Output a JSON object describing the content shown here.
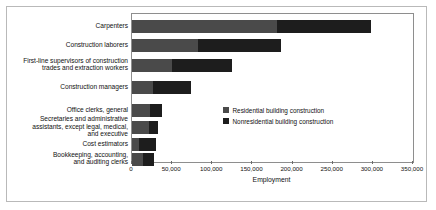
{
  "chart_data": {
    "type": "bar",
    "orientation": "horizontal",
    "stacked": true,
    "title": "",
    "xlabel": "Employment",
    "ylabel": "",
    "xlim": [
      0,
      350000
    ],
    "xticks": [
      0,
      50000,
      100000,
      150000,
      200000,
      250000,
      300000,
      350000
    ],
    "xticklabels": [
      "0",
      "50,000",
      "100,000",
      "150,000",
      "200,000",
      "250,000",
      "300,000",
      "350,000"
    ],
    "grid": false,
    "legend_position": "inside-center-right",
    "categories": [
      "Carpenters",
      "Construction laborers",
      "First-line supervisors of construction trades and extraction workers",
      "Construction managers",
      "Office clerks, general",
      "Secretaries and administrative assistants, except legal, medical, and executive",
      "Cost estimators",
      "Bookkeeping, accounting, and auditing clerks"
    ],
    "category_label_lines": [
      [
        "Carpenters"
      ],
      [
        "Construction laborers"
      ],
      [
        "First-line supervisors of construction",
        "trades and extraction workers"
      ],
      [
        "Construction managers"
      ],
      [
        "Office clerks, general"
      ],
      [
        "Secretaries and administrative",
        "assistants, except legal, medical,",
        "and executive"
      ],
      [
        "Cost estimators"
      ],
      [
        "Bookkeeping, accounting,",
        "and auditing clerks"
      ]
    ],
    "series": [
      {
        "name": "Residential building construction",
        "color": "#4a4a4a",
        "values": [
          180000,
          82000,
          50000,
          26000,
          22000,
          21000,
          9000,
          14000
        ]
      },
      {
        "name": "Nonresidential building construction",
        "color": "#1d1d1d",
        "values": [
          118000,
          103000,
          75000,
          47000,
          15000,
          12000,
          21000,
          14000
        ]
      }
    ],
    "totals": [
      298000,
      185000,
      125000,
      73000,
      37000,
      33000,
      30000,
      28000
    ]
  },
  "legend": {
    "items": [
      {
        "label": "Residential building construction",
        "color": "#4a4a4a"
      },
      {
        "label": "Nonresidential building construction",
        "color": "#1d1d1d"
      }
    ]
  },
  "axis": {
    "x_title": "Employment"
  }
}
